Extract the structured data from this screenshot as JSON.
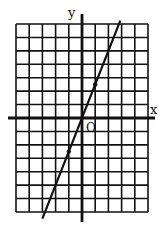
{
  "chart_data": {
    "type": "line",
    "title": "",
    "xlabel": "x",
    "ylabel": "y",
    "origin_label": "O",
    "grid": true,
    "xlim": [
      -5,
      5
    ],
    "ylim": [
      -7,
      7
    ],
    "grid_step": 1,
    "series": [
      {
        "name": "y = 5/2 x",
        "slope": 2.5,
        "intercept": 0,
        "x": [
          -3,
          -1,
          0,
          1,
          2.9
        ],
        "y": [
          -7.5,
          -2.5,
          0,
          2.5,
          7.25
        ]
      }
    ],
    "marked_points": [
      {
        "x": 1,
        "y": 2.5
      },
      {
        "x": -1,
        "y": -2.5
      }
    ]
  },
  "axes": {
    "x_label": "x",
    "y_label": "y",
    "origin_label": "O"
  },
  "colors": {
    "ink": "#111111",
    "background": "#ffffff"
  }
}
